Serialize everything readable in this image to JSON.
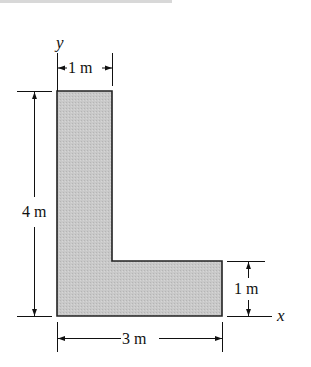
{
  "figure": {
    "shape": "L-shaped area",
    "fill_color": "#c4c4c4",
    "outline_color": "#222222",
    "axes": {
      "y_label": "y",
      "x_label": "x"
    },
    "dimensions": {
      "top_width": "1 m",
      "height": "4 m",
      "bottom_width": "3 m",
      "leg_height": "1 m"
    }
  }
}
